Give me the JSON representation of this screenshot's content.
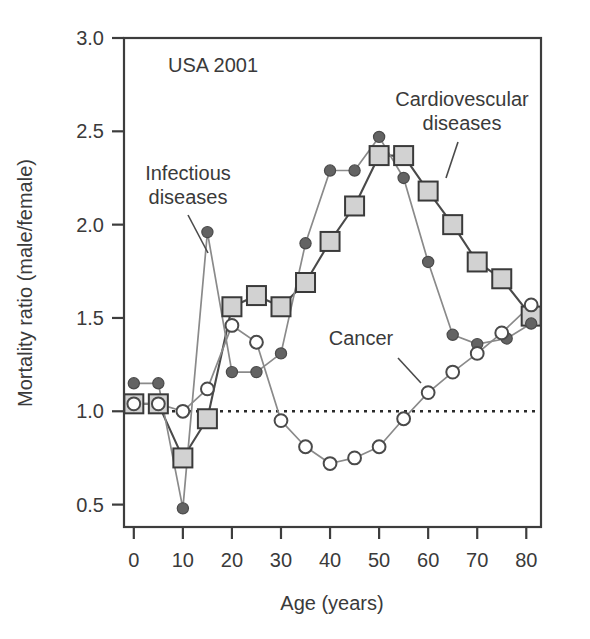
{
  "panel": {
    "title": "USA 2001"
  },
  "axes": {
    "x": {
      "label": "Age (years)",
      "ticks": [
        0,
        10,
        20,
        30,
        40,
        50,
        60,
        70,
        80
      ],
      "tick_labels": [
        "0",
        "10",
        "20",
        "30",
        "40",
        "50",
        "60",
        "70",
        "80"
      ],
      "min": -2,
      "max": 83
    },
    "y": {
      "label": "Mortality ratio (male/female)",
      "ticks": [
        0.5,
        1.0,
        1.5,
        2.0,
        2.5,
        3.0
      ],
      "tick_labels": [
        "0.5",
        "1.0",
        "1.5",
        "2.0",
        "2.5",
        "3.0"
      ],
      "min": 0.38,
      "max": 3.0
    }
  },
  "reference_line": {
    "value": 1.0,
    "style": "dotted",
    "color": "#2b2b2b"
  },
  "annotations": [
    {
      "name": "infectious-diseases",
      "text_line1": "Infectious",
      "text_line2": "diseases",
      "x": 188,
      "y": 180
    },
    {
      "name": "cardiovascular-diseases",
      "text_line1": "Cardiovescular",
      "text_line2": "diseases",
      "x": 462,
      "y": 106
    },
    {
      "name": "cancer",
      "text": "Cancer",
      "x": 361,
      "y": 345
    }
  ],
  "colors": {
    "square_fill": "#d2d2d2",
    "square_stroke": "#3a3a3a",
    "filled_circle": "#636363",
    "open_circle_fill": "#ffffff",
    "open_circle_stroke": "#4a4a4a",
    "dark_line": "#4a4a4a",
    "light_line": "#8a8a8a",
    "text": "#3a3a3a"
  },
  "chart_data": {
    "type": "line",
    "title": "USA 2001",
    "xlabel": "Age (years)",
    "ylabel": "Mortality ratio (male/female)",
    "xlim": [
      -2,
      83
    ],
    "ylim": [
      0.38,
      3.0
    ],
    "grid": false,
    "legend": "inline-annotations",
    "reference_line_y": 1.0,
    "series": [
      {
        "name": "Cardiovescular diseases",
        "marker": "square",
        "x": [
          0,
          5,
          10,
          15,
          20,
          25,
          30,
          35,
          40,
          45,
          50,
          55,
          60,
          65,
          70,
          75,
          81
        ],
        "y": [
          1.04,
          1.04,
          0.75,
          0.96,
          1.56,
          1.62,
          1.56,
          1.69,
          1.91,
          2.1,
          2.37,
          2.37,
          2.18,
          2.0,
          1.8,
          1.71,
          1.51
        ]
      },
      {
        "name": "Infectious diseases",
        "marker": "filled-circle",
        "x": [
          0,
          5,
          10,
          15,
          20,
          25,
          30,
          35,
          40,
          45,
          50,
          55,
          60,
          65,
          70,
          76,
          81
        ],
        "y": [
          1.15,
          1.15,
          0.48,
          1.96,
          1.21,
          1.21,
          1.31,
          1.9,
          2.29,
          2.29,
          2.47,
          2.25,
          1.8,
          1.41,
          1.36,
          1.39,
          1.47
        ]
      },
      {
        "name": "Cancer",
        "marker": "open-circle",
        "x": [
          0,
          5,
          10,
          15,
          20,
          25,
          30,
          35,
          40,
          45,
          50,
          55,
          60,
          65,
          70,
          75,
          81
        ],
        "y": [
          1.04,
          1.04,
          1.0,
          1.12,
          1.46,
          1.37,
          0.95,
          0.81,
          0.72,
          0.75,
          0.81,
          0.96,
          1.1,
          1.21,
          1.31,
          1.42,
          1.57
        ]
      }
    ]
  }
}
